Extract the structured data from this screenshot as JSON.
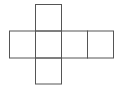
{
  "diagram": {
    "type": "cube-net",
    "stroke_color": "#555555",
    "background": "#ffffff",
    "faces": [
      {
        "id": "top",
        "x": 35.5,
        "y": 4.5,
        "w": 26,
        "h": 26.5
      },
      {
        "id": "left",
        "x": 9.5,
        "y": 31,
        "w": 26,
        "h": 27
      },
      {
        "id": "center",
        "x": 35.5,
        "y": 31,
        "w": 26,
        "h": 27
      },
      {
        "id": "right",
        "x": 61.5,
        "y": 31,
        "w": 26,
        "h": 27
      },
      {
        "id": "far-right",
        "x": 87.5,
        "y": 31,
        "w": 26,
        "h": 27
      },
      {
        "id": "bottom",
        "x": 35.5,
        "y": 58,
        "w": 26,
        "h": 26
      }
    ]
  }
}
